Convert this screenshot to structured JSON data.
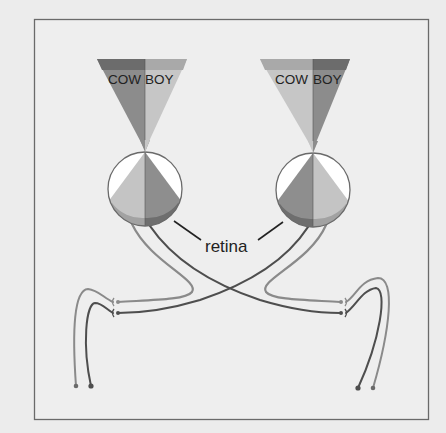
{
  "figure": {
    "colors": {
      "background": "#ececec",
      "frame": "#6a6a6a",
      "dark_band": "#6c6c6c",
      "dark_fill": "#8c8c8c",
      "light_band": "#a9a9a9",
      "light_fill": "#c6c6c6",
      "eye_white": "#ffffff",
      "nerve_light": "#8a8a8a",
      "nerve_dark": "#4a4a4a"
    },
    "left_object": {
      "text_left": "COW",
      "text_right": "BOY"
    },
    "right_object": {
      "text_left": "COW",
      "text_right": "BOY"
    },
    "labels": {
      "retina": "retina"
    }
  }
}
